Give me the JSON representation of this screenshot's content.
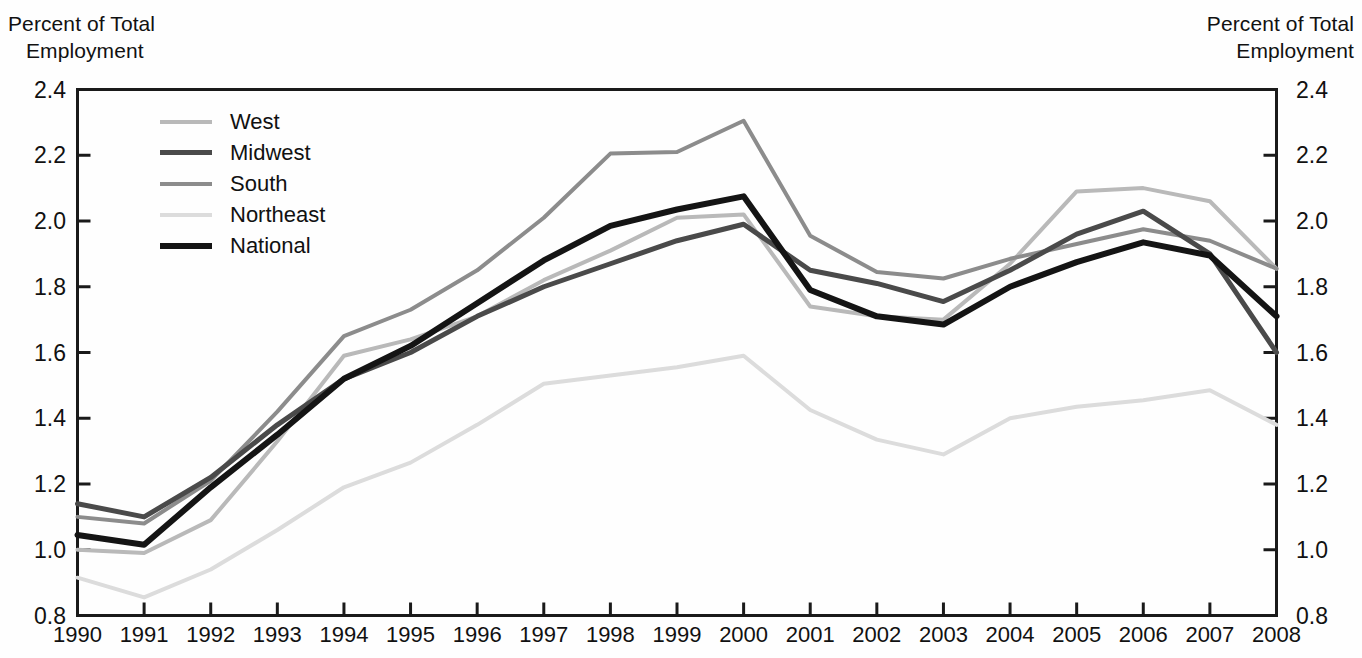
{
  "axis_titles": {
    "left_line1": "Percent of Total",
    "left_line2": "Employment",
    "right_line1": "Percent of Total",
    "right_line2": "Employment"
  },
  "legend": {
    "items": [
      {
        "label": "West",
        "color": "#b9b9b9",
        "width": 4
      },
      {
        "label": "Midwest",
        "color": "#4a4a4a",
        "width": 5
      },
      {
        "label": "South",
        "color": "#8c8c8c",
        "width": 4
      },
      {
        "label": "Northeast",
        "color": "#dcdcdc",
        "width": 4
      },
      {
        "label": "National",
        "color": "#141414",
        "width": 6
      }
    ]
  },
  "chart_data": {
    "type": "line",
    "title": "",
    "xlabel": "",
    "ylabel": "Percent of Total Employment",
    "y2label": "Percent of Total Employment",
    "grid": false,
    "legend_position": "upper-left-inside",
    "xlim": [
      1990,
      2008
    ],
    "ylim": [
      0.8,
      2.4
    ],
    "yticks": [
      0.8,
      1.0,
      1.2,
      1.4,
      1.6,
      1.8,
      2.0,
      2.2,
      2.4
    ],
    "ytick_labels": [
      "0.8",
      "1.0",
      "1.2",
      "1.4",
      "1.6",
      "1.8",
      "2.0",
      "2.2",
      "2.4"
    ],
    "x": [
      1990,
      1991,
      1992,
      1993,
      1994,
      1995,
      1996,
      1997,
      1998,
      1999,
      2000,
      2001,
      2002,
      2003,
      2004,
      2005,
      2006,
      2007,
      2008
    ],
    "xtick_labels": [
      "1990",
      "1991",
      "1992",
      "1993",
      "1994",
      "1995",
      "1996",
      "1997",
      "1998",
      "1999",
      "2000",
      "2001",
      "2002",
      "2003",
      "2004",
      "2005",
      "2006",
      "2007",
      "2008"
    ],
    "series": [
      {
        "name": "West",
        "color": "#b9b9b9",
        "width": 4,
        "values": [
          1.0,
          0.99,
          1.09,
          1.33,
          1.59,
          1.64,
          1.71,
          1.82,
          1.91,
          2.01,
          2.02,
          1.74,
          1.71,
          1.7,
          1.87,
          2.09,
          2.1,
          2.06,
          1.855
        ]
      },
      {
        "name": "Midwest",
        "color": "#4a4a4a",
        "width": 5,
        "values": [
          1.14,
          1.1,
          1.22,
          1.38,
          1.52,
          1.6,
          1.71,
          1.8,
          1.87,
          1.94,
          1.99,
          1.85,
          1.81,
          1.755,
          1.85,
          1.96,
          2.03,
          1.9,
          1.6
        ]
      },
      {
        "name": "South",
        "color": "#8c8c8c",
        "width": 4,
        "values": [
          1.1,
          1.08,
          1.21,
          1.42,
          1.65,
          1.73,
          1.85,
          2.01,
          2.205,
          2.21,
          2.305,
          1.955,
          1.845,
          1.825,
          1.885,
          1.93,
          1.975,
          1.94,
          1.855
        ]
      },
      {
        "name": "Northeast",
        "color": "#dcdcdc",
        "width": 4,
        "values": [
          0.915,
          0.855,
          0.94,
          1.06,
          1.19,
          1.265,
          1.38,
          1.505,
          1.53,
          1.555,
          1.59,
          1.425,
          1.335,
          1.29,
          1.4,
          1.435,
          1.455,
          1.485,
          1.38
        ]
      },
      {
        "name": "National",
        "color": "#141414",
        "width": 6,
        "values": [
          1.045,
          1.015,
          1.19,
          1.35,
          1.52,
          1.62,
          1.75,
          1.88,
          1.985,
          2.035,
          2.075,
          1.79,
          1.71,
          1.685,
          1.8,
          1.875,
          1.935,
          1.895,
          1.71
        ]
      }
    ]
  }
}
